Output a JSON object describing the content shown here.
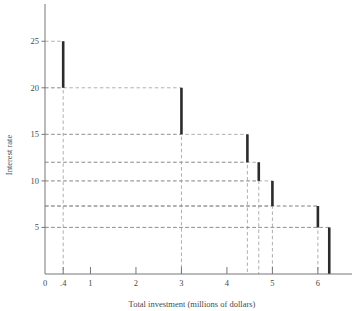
{
  "chart_data": {
    "type": "bar",
    "title": "",
    "subtitle": "",
    "xlabel": "Total investment (millions of dollars)",
    "ylabel": "Interest rate",
    "xlim": [
      0,
      6.75
    ],
    "ylim": [
      0,
      29
    ],
    "xticks": [
      0,
      0.4,
      1,
      2,
      3,
      4,
      5,
      6
    ],
    "xtick_labels": [
      "0",
      ".4",
      "1",
      "2",
      "3",
      "4",
      "5",
      "6"
    ],
    "yticks": [
      5,
      10,
      15,
      20,
      25
    ],
    "ytick_labels": [
      "5",
      "10",
      "15",
      "20",
      "25"
    ],
    "grid": "dashed-guides",
    "legend": "none",
    "series": [
      {
        "name": "Investment demand steps",
        "color": "#2b2b2b",
        "bars": [
          {
            "x": 0.4,
            "y_bottom": 20.0,
            "y_top": 25.0
          },
          {
            "x": 3.0,
            "y_bottom": 15.0,
            "y_top": 20.0
          },
          {
            "x": 4.45,
            "y_bottom": 12.0,
            "y_top": 15.0
          },
          {
            "x": 4.7,
            "y_bottom": 10.0,
            "y_top": 12.0
          },
          {
            "x": 5.0,
            "y_bottom": 7.3,
            "y_top": 10.0
          },
          {
            "x": 6.0,
            "y_bottom": 5.0,
            "y_top": 7.3
          },
          {
            "x": 6.25,
            "y_bottom": 0.0,
            "y_top": 5.0
          }
        ]
      }
    ],
    "guide_levels": [
      5,
      7.3,
      10,
      12,
      15,
      20,
      25
    ],
    "guide_verticals": [
      0.4,
      3.0,
      4.45,
      4.7,
      5.0,
      6.0,
      6.25
    ]
  },
  "axes": {
    "y_title": "Interest rate",
    "x_title": "Total investment (millions of dollars)"
  }
}
